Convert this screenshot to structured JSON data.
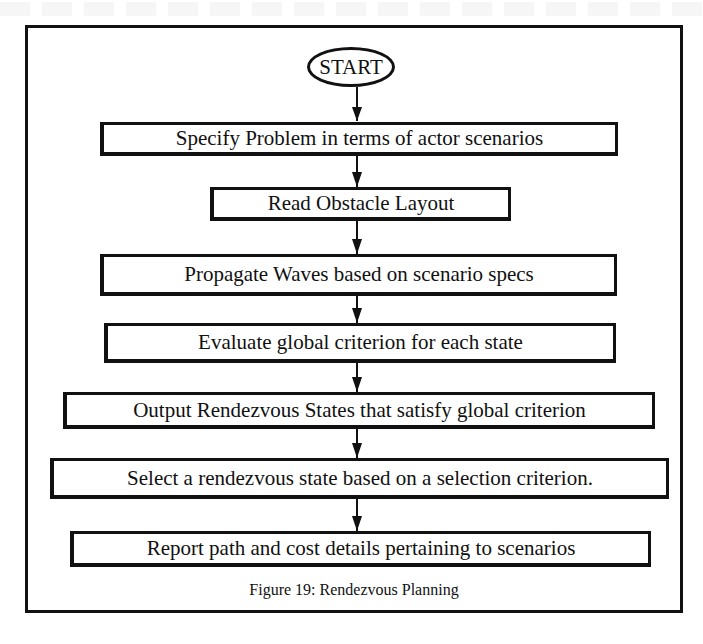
{
  "figure": {
    "caption": "Figure 19: Rendezvous Planning",
    "start_label": "START",
    "steps": [
      {
        "label": "Specify Problem in terms of actor scenarios"
      },
      {
        "label": "Read Obstacle Layout"
      },
      {
        "label": "Propagate Waves based on scenario specs"
      },
      {
        "label": "Evaluate global criterion for each state"
      },
      {
        "label": "Output Rendezvous States that satisfy global criterion"
      },
      {
        "label": "Select a rendezvous state based on a selection criterion."
      },
      {
        "label": "Report path and cost details pertaining to scenarios"
      }
    ],
    "connections": [
      {
        "from": "START",
        "to": "Specify Problem in terms of actor scenarios"
      },
      {
        "from": "Specify Problem in terms of actor scenarios",
        "to": "Read Obstacle Layout"
      },
      {
        "from": "Read Obstacle Layout",
        "to": "Propagate Waves based on scenario specs"
      },
      {
        "from": "Propagate Waves based on scenario specs",
        "to": "Evaluate global criterion for each state"
      },
      {
        "from": "Evaluate global criterion for each state",
        "to": "Output Rendezvous States that satisfy global criterion"
      },
      {
        "from": "Output Rendezvous States that satisfy global criterion",
        "to": "Select a rendezvous state based on a selection criterion."
      },
      {
        "from": "Select a rendezvous state based on a selection criterion.",
        "to": "Report path and cost details pertaining to scenarios"
      }
    ]
  }
}
